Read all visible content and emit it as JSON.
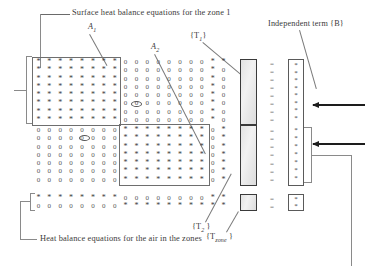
{
  "figure": {
    "title_top": "Surface heat  balance equations for the zone  1",
    "title_bottom": "Heat balance equations for the air in the zones",
    "label_independent_term": "Independent term {B}",
    "label_A1": "A",
    "label_A1_sub": "1",
    "label_A2": "A",
    "label_A2_sub": "2",
    "label_T1_open": "{T",
    "label_T1_sub": "1",
    "label_T1_close": "}",
    "label_T2_open": "{T",
    "label_T2_sub": "2",
    "label_T2_close": " }",
    "label_Tzone_open": "{T",
    "label_Tzone_sub": "zone",
    "label_Tzone_close": " }",
    "glyph_star": "*",
    "glyph_zero": "0",
    "glyph_equals": "=",
    "glyph_dot": "*"
  },
  "matrix": {
    "rows_block1": 8,
    "rows_block2": 7,
    "rows_block3": 2,
    "cols_A1": 8,
    "cols_A2": 8,
    "cols_tail": 2,
    "block1": [
      [
        "*",
        "*",
        "*",
        "*",
        "*",
        "*",
        "*",
        "*",
        "0",
        "0",
        "0",
        "0",
        "0",
        "0",
        "0",
        "0",
        "*",
        "*"
      ],
      [
        "*",
        "*",
        "*",
        "*",
        "*",
        "*",
        "*",
        "*",
        "0",
        "0",
        "0",
        "0",
        "0",
        "0",
        "0",
        "0",
        "*",
        "0"
      ],
      [
        "*",
        "*",
        "*",
        "*",
        "*",
        "*",
        "*",
        "*",
        "0",
        "0",
        "0",
        "0",
        "0",
        "0",
        "0",
        "0",
        "*",
        "0"
      ],
      [
        "*",
        "*",
        "*",
        "*",
        "*",
        "*",
        "*",
        "*",
        "0",
        "0",
        "0",
        "0",
        "0",
        "0",
        "0",
        "0",
        "*",
        "0"
      ],
      [
        "*",
        "*",
        "*",
        "*",
        "*",
        "*",
        "*",
        "*",
        "0",
        "0",
        "0",
        "0",
        "0",
        "0",
        "0",
        "0",
        "*",
        "0"
      ],
      [
        "*",
        "*",
        "*",
        "*",
        "*",
        "*",
        "*",
        "*",
        "0",
        "0",
        "0",
        "0",
        "0",
        "0",
        "0",
        "0",
        "*",
        "0"
      ],
      [
        "*",
        "*",
        "*",
        "*",
        "*",
        "*",
        "*",
        "*",
        "0",
        "0",
        "0",
        "0",
        "0",
        "0",
        "0",
        "0",
        "*",
        "0"
      ],
      [
        "*",
        "*",
        "*",
        "*",
        "*",
        "*",
        "*",
        "*",
        "0",
        "0",
        "0",
        "0",
        "0",
        "0",
        "0",
        "0",
        "*",
        "0"
      ]
    ],
    "block2": [
      [
        "0",
        "0",
        "0",
        "0",
        "0",
        "0",
        "0",
        "0",
        "*",
        "*",
        "*",
        "*",
        "*",
        "*",
        "*",
        "*",
        "0",
        "*"
      ],
      [
        "0",
        "0",
        "0",
        "0",
        "0",
        "0",
        "0",
        "0",
        "*",
        "*",
        "*",
        "*",
        "*",
        "*",
        "*",
        "*",
        "0",
        "*"
      ],
      [
        "0",
        "0",
        "0",
        "0",
        "0",
        "0",
        "0",
        "0",
        "*",
        "*",
        "*",
        "*",
        "*",
        "*",
        "*",
        "*",
        "0",
        "*"
      ],
      [
        "0",
        "0",
        "0",
        "0",
        "0",
        "0",
        "0",
        "0",
        "*",
        "*",
        "*",
        "*",
        "*",
        "*",
        "*",
        "*",
        "0",
        "*"
      ],
      [
        "0",
        "0",
        "0",
        "0",
        "0",
        "0",
        "0",
        "0",
        "*",
        "*",
        "*",
        "*",
        "*",
        "*",
        "*",
        "*",
        "0",
        "*"
      ],
      [
        "0",
        "0",
        "0",
        "0",
        "0",
        "0",
        "0",
        "0",
        "*",
        "*",
        "*",
        "*",
        "*",
        "*",
        "*",
        "*",
        "0",
        "*"
      ],
      [
        "0",
        "0",
        "0",
        "0",
        "0",
        "0",
        "0",
        "0",
        "*",
        "*",
        "*",
        "*",
        "*",
        "*",
        "*",
        "*",
        "0",
        "*"
      ]
    ],
    "block3": [
      [
        "*",
        "*",
        "*",
        "*",
        "*",
        "*",
        "*",
        "*",
        "0",
        "0",
        "0",
        "0",
        "0",
        "0",
        "0",
        "0",
        "*",
        "*"
      ],
      [
        "0",
        "0",
        "0",
        "0",
        "0",
        "0",
        "0",
        "0",
        "*",
        "*",
        "*",
        "*",
        "*",
        "*",
        "*",
        "*",
        "*",
        "*"
      ]
    ]
  },
  "vectors": {
    "T_upper_rows": 8,
    "T_lower_rows": 7,
    "T_zone_rows": 2,
    "equals_count_upper": 8,
    "equals_count_lower": 7,
    "equals_count_bottom": 2,
    "B_dots_upper": 8,
    "B_dots_lower": 7,
    "B_dots_bottom": 2
  }
}
